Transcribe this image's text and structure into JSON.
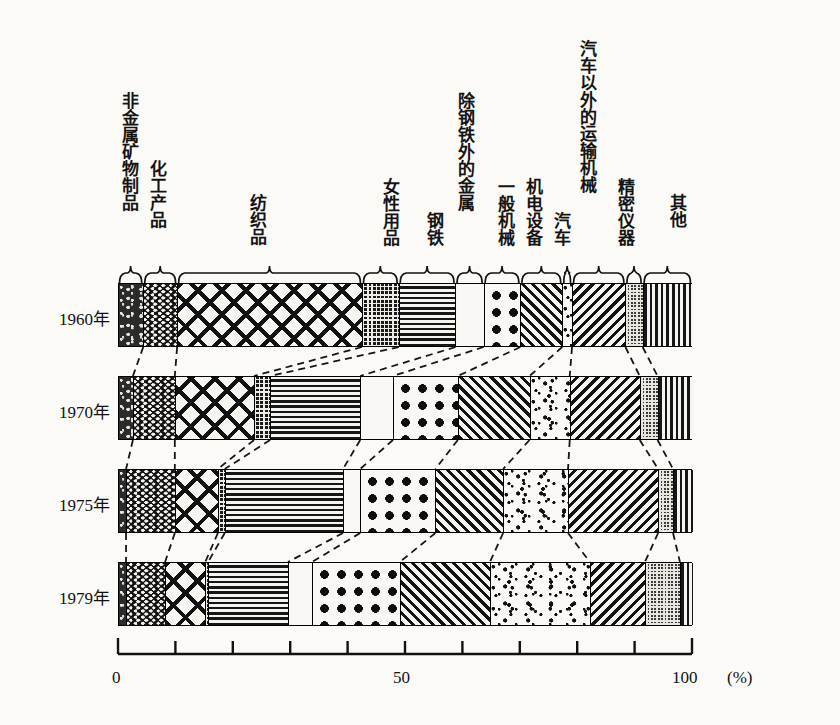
{
  "chart_data": {
    "type": "bar",
    "title": "",
    "xlabel": "(%)",
    "ylabel": "",
    "xlim": [
      0,
      100
    ],
    "grid": false,
    "legend_position": "top-brackets",
    "axis": {
      "unit": "(%)",
      "tick_labels": [
        "0",
        "50",
        "100"
      ],
      "tick_values": [
        0,
        50,
        100
      ],
      "minor_tick_values": [
        10,
        20,
        30,
        40,
        60,
        70,
        80,
        90
      ]
    },
    "categories": [
      "非金属矿物制品",
      "化工产品",
      "纺织品",
      "女性用品",
      "钢铁",
      "除钢铁外的金属",
      "一般机械",
      "机电设备",
      "汽车",
      "汽车以外的运输机械",
      "精密仪器",
      "其他"
    ],
    "category_patterns": [
      "mottled",
      "chevron",
      "crosshatch",
      "grid",
      "horiz",
      "white",
      "dots",
      "diagl",
      "speckle",
      "diagr",
      "checker",
      "vert"
    ],
    "rows": [
      {
        "label": "1960年",
        "values": [
          4.4,
          5.9,
          32.2,
          6.4,
          9.9,
          4.9,
          6.4,
          7.3,
          1.7,
          9.3,
          3.0,
          8.6
        ]
      },
      {
        "label": "1970年",
        "values": [
          2.6,
          7.3,
          13.8,
          2.8,
          15.7,
          5.7,
          11.3,
          12.5,
          7.0,
          12.2,
          3.1,
          6.0
        ]
      },
      {
        "label": "1975年",
        "values": [
          1.4,
          8.5,
          7.5,
          1.2,
          20.6,
          3.0,
          13.1,
          11.8,
          11.3,
          15.7,
          2.6,
          3.3
        ]
      },
      {
        "label": "1979年",
        "values": [
          1.4,
          6.8,
          7.0,
          0.5,
          13.9,
          4.2,
          15.3,
          15.7,
          17.4,
          9.6,
          6.1,
          2.1
        ]
      }
    ]
  }
}
